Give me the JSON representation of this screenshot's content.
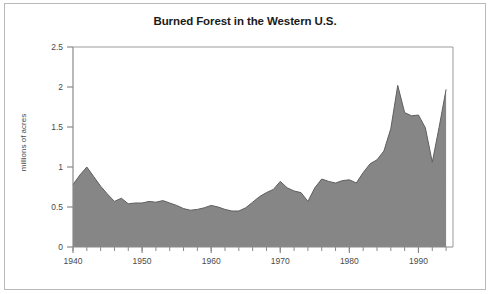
{
  "chart_data": {
    "type": "area",
    "title": "Burned Forest in the Western U.S.",
    "xlabel": "",
    "ylabel": "millions of acres",
    "xlim": [
      1940,
      1995
    ],
    "ylim": [
      0,
      2.5
    ],
    "grid": false,
    "legend": null,
    "series_name": "Burned forest area",
    "x": [
      1940,
      1941,
      1942,
      1943,
      1944,
      1945,
      1946,
      1947,
      1948,
      1949,
      1950,
      1951,
      1952,
      1953,
      1954,
      1955,
      1956,
      1957,
      1958,
      1959,
      1960,
      1961,
      1962,
      1963,
      1964,
      1965,
      1966,
      1967,
      1968,
      1969,
      1970,
      1971,
      1972,
      1973,
      1974,
      1975,
      1976,
      1977,
      1978,
      1979,
      1980,
      1981,
      1982,
      1983,
      1984,
      1985,
      1986,
      1987,
      1988,
      1989,
      1990,
      1991,
      1992,
      1993,
      1994
    ],
    "values": [
      0.78,
      0.9,
      1.0,
      0.88,
      0.76,
      0.66,
      0.57,
      0.61,
      0.54,
      0.55,
      0.55,
      0.57,
      0.56,
      0.58,
      0.55,
      0.52,
      0.48,
      0.46,
      0.47,
      0.49,
      0.52,
      0.5,
      0.47,
      0.45,
      0.45,
      0.49,
      0.56,
      0.63,
      0.68,
      0.72,
      0.82,
      0.74,
      0.7,
      0.68,
      0.57,
      0.74,
      0.85,
      0.82,
      0.8,
      0.83,
      0.84,
      0.8,
      0.93,
      1.04,
      1.09,
      1.2,
      1.48,
      2.02,
      1.68,
      1.64,
      1.65,
      1.49,
      1.06,
      1.5,
      1.97
    ],
    "ytick_values": [
      0,
      0.5,
      1,
      1.5,
      2,
      2.5
    ],
    "ytick_labels": [
      "0",
      "0.5",
      "1",
      "1.5",
      "2",
      "2.5"
    ],
    "xtick_values": [
      1940,
      1950,
      1960,
      1970,
      1980,
      1990
    ],
    "xtick_labels": [
      "1940",
      "1950",
      "1960",
      "1970",
      "1980",
      "1990"
    ],
    "xminor_step": 2,
    "colors": {
      "area_fill": "#868686",
      "area_line": "#5f5f5f",
      "axis": "#8a8a8a",
      "plot_frame": "#9b9b9b",
      "outer_border": "#b9b9b9",
      "title_text": "#1b1b1b",
      "tick_text": "#4a4a4a",
      "background": "#ffffff"
    }
  }
}
